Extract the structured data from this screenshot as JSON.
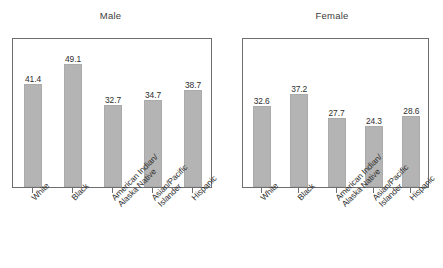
{
  "chart_data": {
    "type": "bar",
    "title": "",
    "xlabel": "",
    "ylabel": "",
    "grid": false,
    "legend": "none",
    "axis_value_labels_shown": false,
    "data_labels_shown": true,
    "ylim": [
      0,
      60
    ],
    "categories": [
      "White",
      "American Indian/ Alaska Native",
      "Asian/Pacific Islander",
      "Black",
      "Hispanic"
    ],
    "category_display": [
      {
        "line1": "White",
        "line2": ""
      },
      {
        "line1": "Black",
        "line2": ""
      },
      {
        "line1": "American Indian/",
        "line2": "Alaska Native"
      },
      {
        "line1": "Asian/Pacific",
        "line2": "Islander"
      },
      {
        "line1": "Hispanic",
        "line2": ""
      }
    ],
    "panels": [
      {
        "title": "Male",
        "categories": [
          "White",
          "Black",
          "American Indian/ Alaska Native",
          "Asian/Pacific Islander",
          "Hispanic"
        ],
        "values": [
          41.4,
          49.1,
          32.7,
          34.7,
          38.7
        ],
        "value_labels": [
          "41.4",
          "49.1",
          "32.7",
          "34.7",
          "38.7"
        ]
      },
      {
        "title": "Female",
        "categories": [
          "White",
          "Black",
          "American Indian/ Alaska Native",
          "Asian/Pacific Islander",
          "Hispanic"
        ],
        "values": [
          32.6,
          37.2,
          27.7,
          24.3,
          28.6
        ],
        "value_labels": [
          "32.6",
          "37.2",
          "27.7",
          "24.3",
          "28.6"
        ]
      }
    ],
    "colors": {
      "bar_fill": "#b4b4b4",
      "bar_border": "#ababab",
      "frame": "#6e6e6e",
      "text": "#2e2e2e",
      "background": "#ffffff"
    }
  }
}
